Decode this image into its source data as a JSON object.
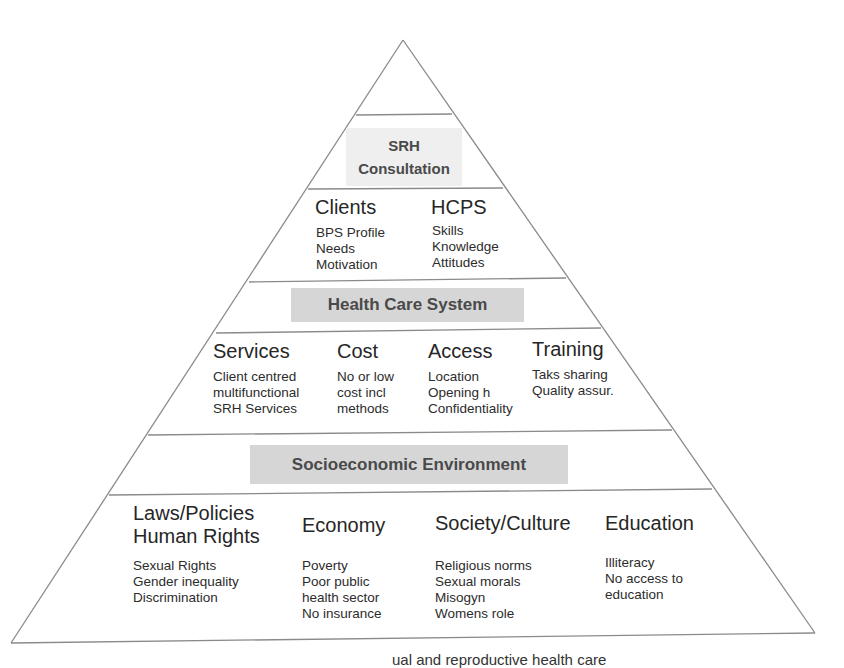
{
  "figure": {
    "type": "pyramid",
    "line_color": "#8a8a8a",
    "label_box_color": "#d6d6d6",
    "label_box_light_color": "#efefef",
    "layers": [
      {
        "label": "SRH Consultation",
        "label_lines": [
          "SRH",
          "Consultation"
        ],
        "categories": [
          {
            "title": "Clients",
            "items": [
              "BPS Profile",
              "Needs",
              "Motivation"
            ]
          },
          {
            "title": "HCPS",
            "items": [
              "Skills",
              "Knowledge",
              "Attitudes"
            ]
          }
        ]
      },
      {
        "label": "Health Care System",
        "categories": [
          {
            "title": "Services",
            "items": [
              "Client centred",
              "multifunctional",
              "SRH Services"
            ]
          },
          {
            "title": "Cost",
            "items": [
              "No or low",
              "cost incl",
              "methods"
            ]
          },
          {
            "title": "Access",
            "items": [
              "Location",
              "Opening h",
              "Confidentiality"
            ]
          },
          {
            "title": "Training",
            "items": [
              "Taks sharing",
              "Quality assur."
            ]
          }
        ]
      },
      {
        "label": "Socioeconomic Environment",
        "categories": [
          {
            "title_lines": [
              "Laws/Policies",
              "Human Rights"
            ],
            "items": [
              "Sexual Rights",
              "Gender inequality",
              "Discrimination"
            ]
          },
          {
            "title": "Economy",
            "items": [
              "Poverty",
              "Poor public",
              "health sector",
              "No insurance"
            ]
          },
          {
            "title": "Society/Culture",
            "items": [
              "Religious norms",
              "Sexual morals",
              "Misogyn",
              "Womens role"
            ]
          },
          {
            "title": "Education",
            "items": [
              "Illiteracy",
              "No access to",
              "education"
            ]
          }
        ]
      }
    ],
    "caption_partial": "ual and reproductive health care"
  }
}
